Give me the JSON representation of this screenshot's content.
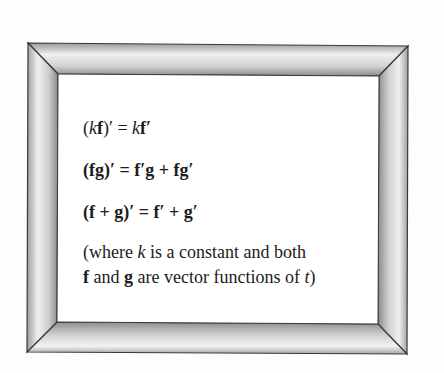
{
  "frame": {
    "outer": {
      "tl": [
        28,
        43
      ],
      "tr": [
        408,
        46
      ],
      "br": [
        407,
        354
      ],
      "bl": [
        27,
        352
      ]
    },
    "inner": {
      "tl": [
        58,
        74
      ],
      "tr": [
        379,
        76
      ],
      "br": [
        378,
        324
      ],
      "bl": [
        57,
        322
      ]
    },
    "colors": {
      "edge": "#3a3a3a",
      "light": "#f2f2f2",
      "mid": "#c4c4c4",
      "dark": "#8a8a8a"
    }
  },
  "formulas": [
    {
      "id": "scalar-rule",
      "parts": [
        {
          "t": "(",
          "s": "r"
        },
        {
          "t": "k",
          "s": "i"
        },
        {
          "t": "f",
          "s": "b"
        },
        {
          "t": ")′ = ",
          "s": "r"
        },
        {
          "t": "k",
          "s": "i"
        },
        {
          "t": "f′",
          "s": "b"
        }
      ],
      "plain": "(kf)′ = kf′"
    },
    {
      "id": "product-rule",
      "parts": [
        {
          "t": "(fg)′ = f′g + fg′",
          "s": "b"
        }
      ],
      "plain": "(fg)′ = f′g + fg′"
    },
    {
      "id": "sum-rule",
      "parts": [
        {
          "t": "(f + g)′ = f′ + g′",
          "s": "b"
        }
      ],
      "plain": "(f + g)′ = f′ + g′"
    }
  ],
  "note": {
    "line1": [
      {
        "t": "(where ",
        "s": "r"
      },
      {
        "t": "k",
        "s": "i"
      },
      {
        "t": " is a constant and both",
        "s": "r"
      }
    ],
    "line2": [
      {
        "t": " f",
        "s": "b"
      },
      {
        "t": " and ",
        "s": "r"
      },
      {
        "t": "g",
        "s": "b"
      },
      {
        "t": " are vector functions of ",
        "s": "r"
      },
      {
        "t": "t",
        "s": "i"
      },
      {
        "t": ")",
        "s": "r"
      }
    ],
    "plain": "(where k is a constant and both f and g are vector functions of t)"
  }
}
